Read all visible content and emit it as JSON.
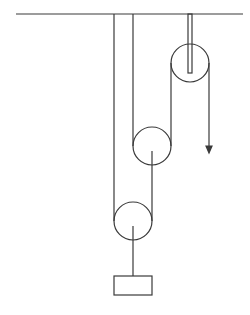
{
  "diagram": {
    "type": "pulley-system",
    "stroke_color": "#3a3a3a",
    "background": "#ffffff",
    "ceiling": {
      "x1": 16,
      "x2": 243,
      "y": 14
    },
    "fixed_pulley": {
      "cx": 190,
      "cy": 63,
      "r": 19,
      "rod": {
        "x": 188,
        "y": 15,
        "w": 4,
        "h": 58
      }
    },
    "middle_pulley": {
      "cx": 152,
      "cy": 146,
      "r": 19
    },
    "bottom_pulley": {
      "cx": 133,
      "cy": 221,
      "r": 19
    },
    "weight_box": {
      "x": 114,
      "y": 276,
      "w": 38,
      "h": 19
    },
    "pull_arrow": {
      "x": 209,
      "y1": 63,
      "y2": 152,
      "direction": "down"
    }
  }
}
